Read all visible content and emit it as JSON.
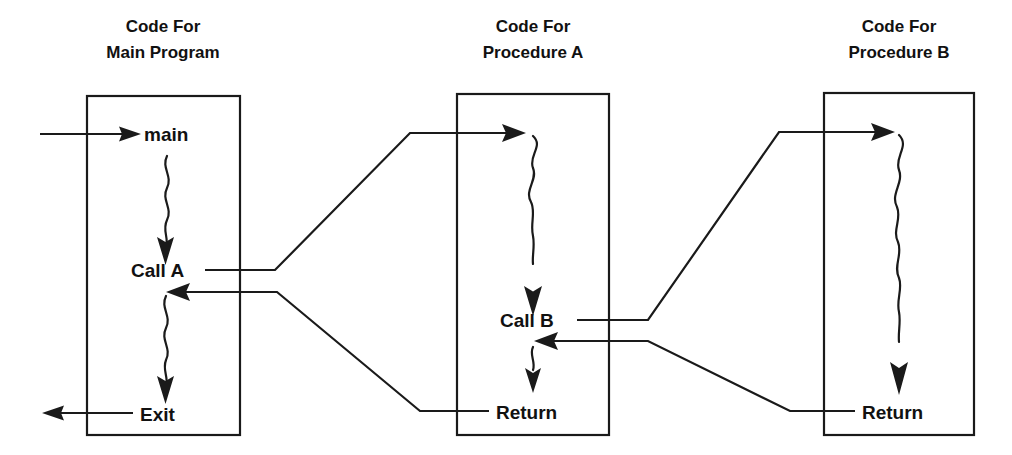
{
  "diagram": {
    "stroke_color": "#1a1a1a",
    "text_color": "#111111",
    "background_color": "#ffffff",
    "columns": [
      {
        "id": "main",
        "title_line1": "Code For",
        "title_line2": "Main Program",
        "nodes": [
          {
            "id": "main-entry",
            "label": "main"
          },
          {
            "id": "call-a",
            "label": "Call A"
          },
          {
            "id": "exit",
            "label": "Exit"
          }
        ]
      },
      {
        "id": "proc-a",
        "title_line1": "Code For",
        "title_line2": "Procedure A",
        "nodes": [
          {
            "id": "call-b",
            "label": "Call B"
          },
          {
            "id": "return-a",
            "label": "Return"
          }
        ]
      },
      {
        "id": "proc-b",
        "title_line1": "Code For",
        "title_line2": "Procedure B",
        "nodes": [
          {
            "id": "return-b",
            "label": "Return"
          }
        ]
      }
    ],
    "icons": {
      "squiggle": "wavy-execution-arrow-icon",
      "arrow": "arrow-head-icon"
    },
    "connections": [
      {
        "id": "program-start",
        "from": "external",
        "to": "main",
        "kind": "entry-arrow"
      },
      {
        "id": "call-a-to-proc-a",
        "from": "Call A",
        "to": "Procedure A",
        "kind": "call"
      },
      {
        "id": "return-a-to-main",
        "from": "Return",
        "to": "Call A",
        "kind": "return"
      },
      {
        "id": "call-b-to-proc-b",
        "from": "Call B",
        "to": "Procedure B",
        "kind": "call"
      },
      {
        "id": "return-b-to-proc-a",
        "from": "Return",
        "to": "Call B",
        "kind": "return"
      },
      {
        "id": "program-exit",
        "from": "Exit",
        "to": "external",
        "kind": "exit-arrow"
      }
    ]
  }
}
